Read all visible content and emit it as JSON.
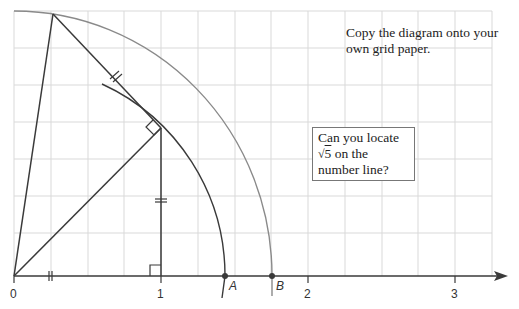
{
  "notes": {
    "copy_instruction": "Copy the diagram onto your own grid paper.",
    "question_line1": "Can you locate",
    "question_sqrt_symbol": "√",
    "question_sqrt_value": "5",
    "question_line2_rest": " on the",
    "question_line3": "number line?"
  },
  "number_line": {
    "tick_labels": [
      "0",
      "1",
      "2",
      "3"
    ]
  },
  "points": {
    "A": "A",
    "B": "B"
  },
  "colors": {
    "grid": "#d8d8d8",
    "lines": "#3a3a3a",
    "outer_arc": "#888888",
    "text": "#222222"
  }
}
